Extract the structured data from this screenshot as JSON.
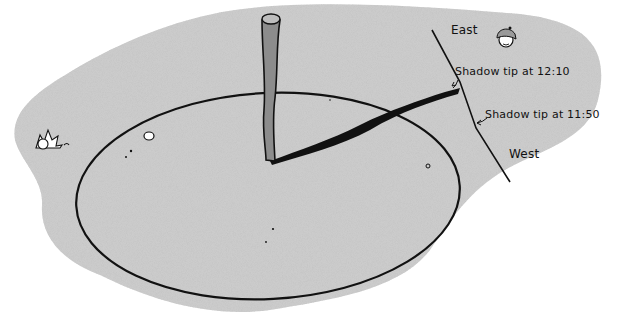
{
  "diagram": {
    "type": "illustration",
    "labels": {
      "east": "East",
      "west": "West",
      "tip_1210": "Shadow tip at 12:10",
      "tip_1150": "Shadow tip at 11:50"
    },
    "elements": [
      {
        "name": "ground-patch",
        "description": "speckled gray ground"
      },
      {
        "name": "circle",
        "description": "large ellipse drawn around the stick"
      },
      {
        "name": "stick",
        "description": "vertical wooden stick (gnomon)"
      },
      {
        "name": "shadow",
        "description": "black shadow from stick base to circle edge"
      },
      {
        "name": "east-west-line",
        "description": "line connecting shadow tips"
      },
      {
        "name": "sun-face",
        "description": "small smiling character with cap"
      },
      {
        "name": "plant",
        "description": "small leafy plant at left"
      },
      {
        "name": "pebbles",
        "description": "small stones on ground"
      }
    ],
    "colors": {
      "ground": "#c9c9c9",
      "background": "#ffffff",
      "ink": "#111111",
      "stick": "#8c8c8c"
    }
  }
}
